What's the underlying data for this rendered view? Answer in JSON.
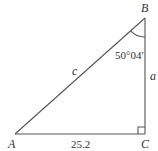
{
  "diagram": {
    "type": "right-triangle",
    "vertices": {
      "A": {
        "label": "A"
      },
      "B": {
        "label": "B"
      },
      "C": {
        "label": "C"
      }
    },
    "sides": {
      "hypotenuse": {
        "label": "c"
      },
      "vertical": {
        "label": "a"
      },
      "base": {
        "label": "25.2"
      }
    },
    "angle_B": {
      "label": "50°04′"
    },
    "right_angle_at": "C",
    "line_color": "#555555"
  }
}
